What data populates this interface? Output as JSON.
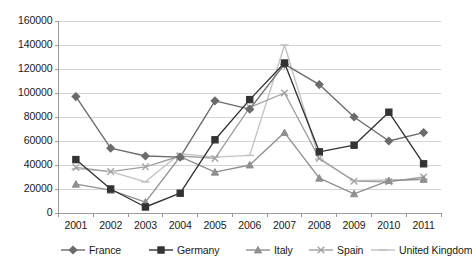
{
  "chart_data": {
    "type": "line",
    "title": "",
    "subtitle": "",
    "xlabel": "",
    "ylabel": "",
    "categories": [
      "2001",
      "2002",
      "2003",
      "2004",
      "2005",
      "2006",
      "2007",
      "2008",
      "2009",
      "2010",
      "2011"
    ],
    "ylim": [
      0,
      160000
    ],
    "ytick_labels": [
      "0",
      "20000",
      "40000",
      "60000",
      "80000",
      "100000",
      "120000",
      "140000",
      "160000"
    ],
    "ytick_values": [
      0,
      20000,
      40000,
      60000,
      80000,
      100000,
      120000,
      140000,
      160000
    ],
    "grid": "horizontal",
    "legend_position": "bottom",
    "series": [
      {
        "name": "France",
        "marker": "diamond",
        "color": "#6b6b6b",
        "values": [
          97000,
          54000,
          47500,
          46500,
          93500,
          86500,
          124000,
          107000,
          80000,
          60000,
          67000
        ]
      },
      {
        "name": "Germany",
        "marker": "square",
        "color": "#333333",
        "values": [
          44500,
          20000,
          5000,
          16500,
          61000,
          94500,
          125000,
          51000,
          56500,
          84000,
          41000
        ]
      },
      {
        "name": "Italy",
        "marker": "triangle",
        "color": "#8f8f8f",
        "values": [
          24000,
          19000,
          9000,
          47000,
          34000,
          40000,
          67000,
          29000,
          16000,
          27000,
          28000
        ]
      },
      {
        "name": "Spain",
        "marker": "x",
        "color": "#a0a0a0",
        "values": [
          38000,
          34500,
          38500,
          47500,
          45500,
          88000,
          100000,
          45500,
          26500,
          26000,
          30000
        ]
      },
      {
        "name": "United Kingdom",
        "marker": "dash",
        "color": "#c2c2c2",
        "values": [
          37000,
          34500,
          26000,
          49500,
          46500,
          48000,
          140000,
          45000,
          27000,
          27500,
          28000
        ]
      }
    ]
  },
  "axis": {
    "axis_color": "#9a9a9a",
    "grid_color": "#d4d4d4"
  }
}
